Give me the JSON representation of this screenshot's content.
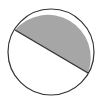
{
  "diagram": {
    "type": "circle-segment",
    "circle": {
      "cx": 51,
      "cy": 52,
      "r": 43
    },
    "chord": {
      "x1": 15,
      "y1": 30,
      "x2": 88,
      "y2": 73
    },
    "colors": {
      "shaded": "#a6a6a6",
      "unshaded": "#ffffff",
      "stroke": "#333333"
    }
  }
}
